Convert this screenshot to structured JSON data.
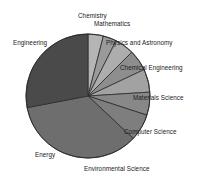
{
  "chart_data": {
    "type": "pie",
    "title": "",
    "subtitle": "",
    "xlabel": "",
    "ylabel": "",
    "legend_position": "none",
    "grid": false,
    "labels_position": "outside",
    "start_angle_deg": 0,
    "direction": "clockwise",
    "categories": [
      "Chemistry",
      "Mathematics",
      "Physics and Astronomy",
      "Chemical Engineering",
      "Materials Science",
      "Computer Science",
      "Environmental Science",
      "Energy",
      "Engineering"
    ],
    "values": [
      4.0,
      3.5,
      5.0,
      5.5,
      6.0,
      6.0,
      7.0,
      35.0,
      28.0
    ],
    "slices": [
      {
        "label": "Chemistry",
        "value": 4.0,
        "color": "#b5b5b5"
      },
      {
        "label": "Mathematics",
        "value": 3.5,
        "color": "#9a9a9a"
      },
      {
        "label": "Physics and Astronomy",
        "value": 5.0,
        "color": "#adadad"
      },
      {
        "label": "Chemical Engineering",
        "value": 5.5,
        "color": "#8e8e8e"
      },
      {
        "label": "Materials Science",
        "value": 6.0,
        "color": "#a2a2a2"
      },
      {
        "label": "Computer Science",
        "value": 6.0,
        "color": "#888888"
      },
      {
        "label": "Environmental Science",
        "value": 7.0,
        "color": "#7e7e7e"
      },
      {
        "label": "Energy",
        "value": 35.0,
        "color": "#6e6e6e"
      },
      {
        "label": "Engineering",
        "value": 28.0,
        "color": "#4a4a4a"
      }
    ]
  },
  "labels": {
    "chemistry": "Chemistry",
    "mathematics": "Mathematics",
    "physics_and_astronomy": "Physics and Astronomy",
    "chemical_engineering": "Chemical Engineering",
    "materials_science": "Materials Science",
    "computer_science": "Computer Science",
    "environmental_science": "Environmental Science",
    "energy": "Energy",
    "engineering": "Engineering"
  },
  "style": {
    "background": "#ffffff",
    "slice_edge_color": "#2b2b2b",
    "label_color": "#1a1a1a"
  }
}
